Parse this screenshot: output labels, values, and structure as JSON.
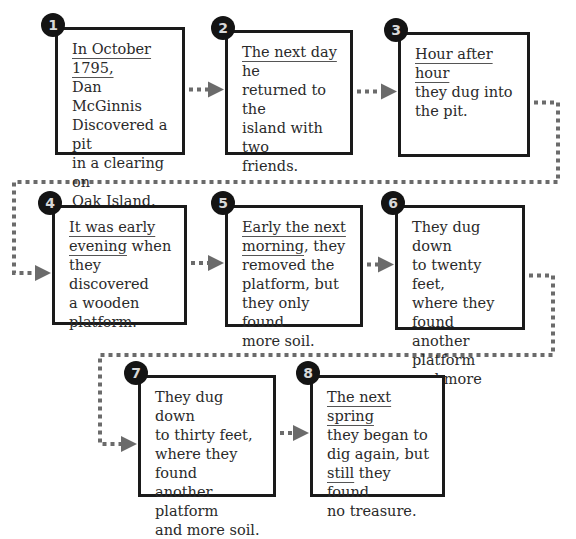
{
  "diagram": {
    "type": "sequence-flowchart",
    "colors": {
      "box_border": "#1a1a1a",
      "badge_bg": "#141414",
      "connector": "#6b6b6b",
      "text": "#2a2a2a"
    },
    "steps": [
      {
        "number": "1",
        "lines": [
          {
            "text": "In October 1795,",
            "underline": true
          },
          {
            "text": "Dan McGinnis"
          },
          {
            "text": "Discovered a pit"
          },
          {
            "text": "in a clearing on"
          },
          {
            "text": "Oak Island."
          }
        ]
      },
      {
        "number": "2",
        "lines": [
          {
            "text": "The next day",
            "underline": true,
            "rest": " he"
          },
          {
            "text": "returned to the"
          },
          {
            "text": "island with two"
          },
          {
            "text": "friends."
          }
        ]
      },
      {
        "number": "3",
        "lines": [
          {
            "text": "Hour after hour",
            "underline": true
          },
          {
            "text": "they dug into"
          },
          {
            "text": "the pit."
          }
        ]
      },
      {
        "number": "4",
        "lines": [
          {
            "text": "It was early",
            "underline": true
          },
          {
            "text": "evening",
            "underline": true,
            "rest": " when"
          },
          {
            "text": "they discovered"
          },
          {
            "text": "a wooden"
          },
          {
            "text": "platform."
          }
        ]
      },
      {
        "number": "5",
        "lines": [
          {
            "text": "Early the next",
            "underline": true
          },
          {
            "text": "morning",
            "underline": true,
            "rest": ", they"
          },
          {
            "text": "removed the"
          },
          {
            "text": "platform, but"
          },
          {
            "text": "they only found"
          },
          {
            "text": "more soil."
          }
        ]
      },
      {
        "number": "6",
        "lines": [
          {
            "text": "They dug down"
          },
          {
            "text": "to twenty feet,"
          },
          {
            "text": "where they found"
          },
          {
            "text": "another platform"
          },
          {
            "text": "and more soil."
          }
        ]
      },
      {
        "number": "7",
        "lines": [
          {
            "text": "They dug down"
          },
          {
            "text": "to thirty feet,"
          },
          {
            "text": "where they found"
          },
          {
            "text": "another platform"
          },
          {
            "text": "and more soil."
          }
        ]
      },
      {
        "number": "8",
        "lines": [
          {
            "text": "The next spring",
            "underline": true
          },
          {
            "text": "they began to"
          },
          {
            "text": "dig again, but"
          },
          {
            "text": "still",
            "underline": true,
            "rest": " they found"
          },
          {
            "text": "no treasure."
          }
        ]
      }
    ],
    "connections": [
      {
        "from": "1",
        "to": "2"
      },
      {
        "from": "2",
        "to": "3"
      },
      {
        "from": "3",
        "to": "4"
      },
      {
        "from": "4",
        "to": "5"
      },
      {
        "from": "5",
        "to": "6"
      },
      {
        "from": "6",
        "to": "7"
      },
      {
        "from": "7",
        "to": "8"
      }
    ]
  }
}
